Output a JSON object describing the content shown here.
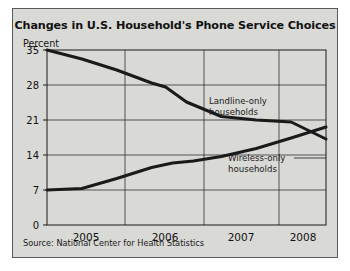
{
  "figure": {
    "title": "Changes in U.S. Household's Phone Service Choices",
    "y_axis_title": "Percent",
    "source": "Source: National Center for Health Statistics",
    "background_color": "#d9d9d6",
    "border_color": "#5a5a58",
    "line_color": "#1a1a1a"
  },
  "chart_data": {
    "type": "line",
    "title": "Changes in U.S. Household's Phone Service Choices",
    "xlabel": "",
    "ylabel": "Percent",
    "ylim": [
      0,
      35
    ],
    "xlim": [
      2004.5,
      2008.5
    ],
    "yticks": [
      0,
      7,
      14,
      21,
      28,
      35
    ],
    "ytick_labels": [
      "0",
      "7",
      "14",
      "21",
      "28",
      "35"
    ],
    "xticks": [
      2005,
      2006,
      2007,
      2008
    ],
    "xtick_labels": [
      "2005",
      "2006",
      "2007",
      "2008"
    ],
    "grid": true,
    "legend_position": "inline-annotation",
    "series": [
      {
        "name": "Landline-only households",
        "label": "Landline-only\nhouseholds",
        "label_line1": "Landline-only",
        "label_line2": "households",
        "x": [
          2004.5,
          2005.0,
          2005.5,
          2006.0,
          2006.2,
          2006.5,
          2007.0,
          2007.5,
          2008.0,
          2008.5
        ],
        "values": [
          35.0,
          33.2,
          31.0,
          28.4,
          27.6,
          24.6,
          21.7,
          21.0,
          20.6,
          17.2
        ]
      },
      {
        "name": "Wireless-only households",
        "label": "Wireless-only\nhouseholds",
        "label_line1": "Wireless-only",
        "label_line2": "households",
        "x": [
          2004.5,
          2005.0,
          2005.5,
          2006.0,
          2006.3,
          2006.6,
          2007.0,
          2007.5,
          2008.0,
          2008.5
        ],
        "values": [
          7.0,
          7.3,
          9.3,
          11.5,
          12.4,
          12.8,
          13.7,
          15.3,
          17.4,
          19.6
        ]
      }
    ],
    "annotations": [
      {
        "text": "Landline-only households",
        "x": 2007.0,
        "y": 25.0
      },
      {
        "text": "Wireless-only households",
        "x": 2007.5,
        "y": 14.2
      }
    ]
  }
}
